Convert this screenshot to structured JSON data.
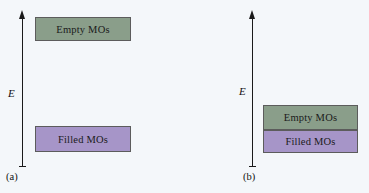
{
  "figure": {
    "background_color": "#f4f7fa",
    "width": 369,
    "height": 193
  },
  "colors": {
    "empty_mo_fill": "#8a9e8a",
    "filled_mo_fill": "#a695c8",
    "box_border": "#5c5c5c",
    "axis": "#1a1a1a",
    "text": "#111111"
  },
  "panels": [
    {
      "id": "a",
      "label": "(a)",
      "axis": {
        "label": "E",
        "label_meaning": "energy",
        "direction": "up",
        "arrow_icon": "up-arrow-icon"
      },
      "levels": [
        {
          "name": "empty-mos",
          "label": "Empty MOs",
          "fill": "#8a9e8a",
          "position": "high"
        },
        {
          "name": "filled-mos",
          "label": "Filled MOs",
          "fill": "#a695c8",
          "position": "low"
        }
      ],
      "gap": "large band gap between filled and empty MOs"
    },
    {
      "id": "b",
      "label": "(b)",
      "axis": {
        "label": "E",
        "label_meaning": "energy",
        "direction": "up",
        "arrow_icon": "up-arrow-icon"
      },
      "levels": [
        {
          "name": "empty-mos",
          "label": "Empty MOs",
          "fill": "#8a9e8a",
          "position": "upper"
        },
        {
          "name": "filled-mos",
          "label": "Filled MOs",
          "fill": "#a695c8",
          "position": "lower"
        }
      ],
      "gap": "no gap — filled and empty MO bands are adjacent"
    }
  ]
}
